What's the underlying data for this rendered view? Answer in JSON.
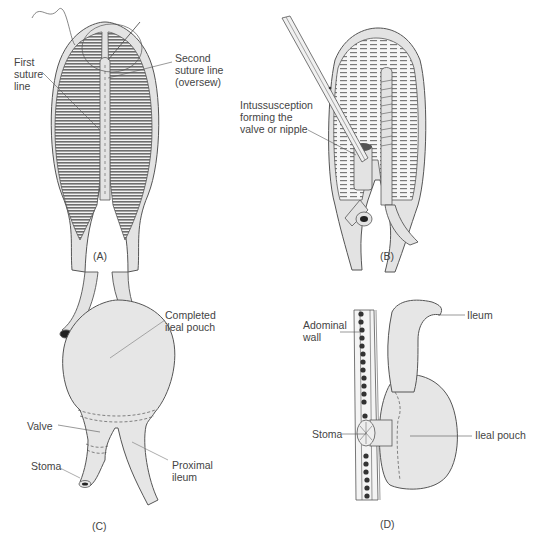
{
  "figure": {
    "panels": [
      {
        "id": "A",
        "caption": "(A)",
        "labels": {
          "first_suture_line": "First\nsuture\nline",
          "second_suture_line": "Second\nsuture line\n(oversew)"
        }
      },
      {
        "id": "B",
        "caption": "(B)",
        "labels": {
          "intussusception": "Intussusception\nforming the\nvalve or nipple"
        }
      },
      {
        "id": "C",
        "caption": "(C)",
        "labels": {
          "completed_pouch": "Completed\nileal pouch",
          "valve": "Valve",
          "stoma": "Stoma",
          "proximal_ileum": "Proximal\nileum"
        }
      },
      {
        "id": "D",
        "caption": "(D)",
        "labels": {
          "abdominal_wall": "Adominal\nwall",
          "ileum": "Ileum",
          "stoma": "Stoma",
          "ileal_pouch": "Ileal pouch"
        }
      }
    ],
    "colors": {
      "tissue_fill": "#e3e3e3",
      "outline": "#555555",
      "stripe": "#6e6e6e",
      "wall_dots": "#333333"
    }
  }
}
